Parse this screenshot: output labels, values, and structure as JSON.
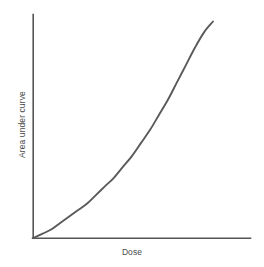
{
  "chart_data": {
    "type": "line",
    "title": "",
    "subtitle": "",
    "xlabel": "Dose",
    "ylabel": "Area under curve",
    "grid": false,
    "legend": null,
    "xlim": [
      0,
      1
    ],
    "ylim": [
      0,
      1
    ],
    "axis_ticks": {
      "x": [],
      "y": []
    },
    "annotations": [],
    "series": [
      {
        "name": "Area under curve vs Dose",
        "description": "Supralinear (convex, upward-curving) exponential-like increase from origin",
        "x": [
          0.0,
          0.05,
          0.1,
          0.15,
          0.2,
          0.25,
          0.3,
          0.35,
          0.4,
          0.45,
          0.5,
          0.55,
          0.6,
          0.65,
          0.7,
          0.75,
          0.8,
          0.85,
          0.9,
          0.95,
          1.0
        ],
        "y": [
          0.0,
          0.02,
          0.04,
          0.07,
          0.1,
          0.13,
          0.16,
          0.2,
          0.24,
          0.28,
          0.33,
          0.38,
          0.44,
          0.5,
          0.57,
          0.64,
          0.72,
          0.8,
          0.88,
          0.95,
          1.0
        ]
      }
    ],
    "colors": {
      "curve": "#5a5a5a",
      "axis": "#555555",
      "background": "#ffffff",
      "label_text": "#4a4a4a"
    }
  },
  "figure": {
    "width": 264,
    "height": 267
  }
}
